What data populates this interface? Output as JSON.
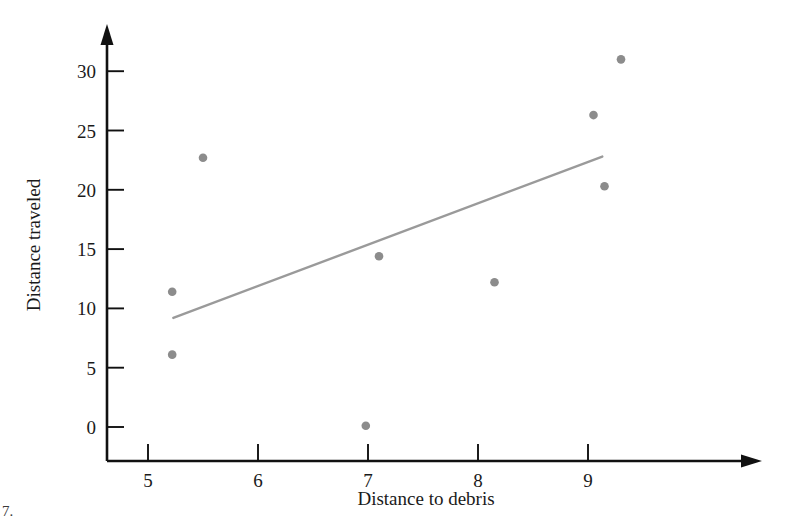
{
  "chart_data": {
    "type": "scatter",
    "title": "",
    "xlabel": "Distance to debris",
    "ylabel": "Distance traveled",
    "xlim": [
      4.6,
      9.6
    ],
    "ylim": [
      -2.5,
      33
    ],
    "xticks": [
      5,
      6,
      7,
      8,
      9
    ],
    "xtick_labels": [
      "5",
      "6",
      "7",
      "8",
      "9"
    ],
    "yticks": [
      0,
      5,
      10,
      15,
      20,
      25,
      30
    ],
    "ytick_labels": [
      "0",
      "5",
      "10",
      "15",
      "20",
      "25",
      "30"
    ],
    "grid": false,
    "legend": null,
    "series": [
      {
        "name": "observations",
        "marker": "circle",
        "color": "#8c8c8c",
        "points": [
          {
            "x": 5.22,
            "y": 11.4
          },
          {
            "x": 5.22,
            "y": 6.1
          },
          {
            "x": 5.5,
            "y": 22.7
          },
          {
            "x": 6.98,
            "y": 0.1
          },
          {
            "x": 7.1,
            "y": 14.4
          },
          {
            "x": 8.15,
            "y": 12.2
          },
          {
            "x": 9.05,
            "y": 26.3
          },
          {
            "x": 9.15,
            "y": 20.3
          },
          {
            "x": 9.3,
            "y": 31.0
          }
        ]
      },
      {
        "name": "trend-line",
        "type": "line",
        "color": "#9a9a9a",
        "x_start": 5.23,
        "y_start": 9.2,
        "x_end": 9.13,
        "y_end": 22.8
      }
    ]
  },
  "corner": {
    "mark": "7."
  }
}
